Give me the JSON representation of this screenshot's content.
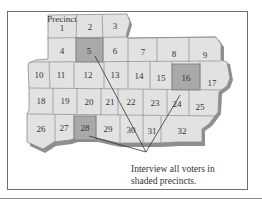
{
  "diagram": {
    "label": "Precinct",
    "caption_line1": "Interview all voters in",
    "caption_line2": "shaded precincts.",
    "colors": {
      "precinct_fill": "#e2e2e2",
      "shaded_fill": "#a9a9a9",
      "border": "#8c8c8c",
      "shadow": "#8f8f8f",
      "text": "#333333",
      "arrow": "#333333"
    },
    "shaded_precincts": [
      5,
      16,
      28
    ],
    "precincts": [
      {
        "id": 1,
        "label": "1"
      },
      {
        "id": 2,
        "label": "2"
      },
      {
        "id": 3,
        "label": "3"
      },
      {
        "id": 4,
        "label": "4"
      },
      {
        "id": 5,
        "label": "5"
      },
      {
        "id": 6,
        "label": "6"
      },
      {
        "id": 7,
        "label": "7"
      },
      {
        "id": 8,
        "label": "8"
      },
      {
        "id": 9,
        "label": "9"
      },
      {
        "id": 10,
        "label": "10"
      },
      {
        "id": 11,
        "label": "11"
      },
      {
        "id": 12,
        "label": "12"
      },
      {
        "id": 13,
        "label": "13"
      },
      {
        "id": 14,
        "label": "14"
      },
      {
        "id": 15,
        "label": "15"
      },
      {
        "id": 16,
        "label": "16"
      },
      {
        "id": 17,
        "label": "17"
      },
      {
        "id": 18,
        "label": "18"
      },
      {
        "id": 19,
        "label": "19"
      },
      {
        "id": 20,
        "label": "20"
      },
      {
        "id": 21,
        "label": "21"
      },
      {
        "id": 22,
        "label": "22"
      },
      {
        "id": 23,
        "label": "23"
      },
      {
        "id": 24,
        "label": "24"
      },
      {
        "id": 25,
        "label": "25"
      },
      {
        "id": 26,
        "label": "26"
      },
      {
        "id": 27,
        "label": "27"
      },
      {
        "id": 28,
        "label": "28"
      },
      {
        "id": 29,
        "label": "29"
      },
      {
        "id": 30,
        "label": "30"
      },
      {
        "id": 31,
        "label": "31"
      },
      {
        "id": 32,
        "label": "32"
      }
    ]
  }
}
